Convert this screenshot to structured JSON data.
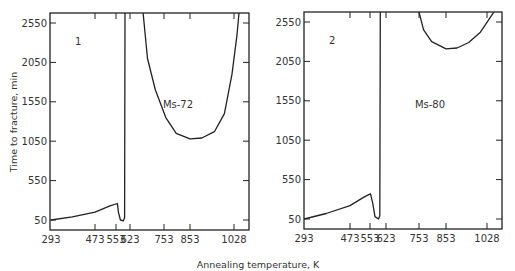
{
  "chart_data": [
    {
      "type": "line",
      "panel_label": "1",
      "annotation": "Ms-72",
      "xlabel": "Annealing temperature, K",
      "ylabel": "Time to fracture, min",
      "xticks": [
        293,
        473,
        553,
        623,
        753,
        853,
        1028
      ],
      "yticks": [
        50,
        550,
        1050,
        1550,
        2050,
        2550
      ],
      "xlim": [
        293,
        1073
      ],
      "ylim": [
        0,
        2680
      ],
      "series": [
        {
          "name": "low-temperature branch",
          "x": [
            293,
            380,
            473,
            530,
            560,
            565,
            575,
            590,
            596,
            598
          ],
          "y": [
            50,
            90,
            150,
            230,
            260,
            150,
            50,
            40,
            80,
            2680
          ]
        },
        {
          "name": "Ms-72 U-curve",
          "x": [
            673,
            690,
            720,
            760,
            800,
            853,
            900,
            950,
            990,
            1020,
            1040,
            1048
          ],
          "y": [
            2680,
            2100,
            1700,
            1350,
            1150,
            1080,
            1090,
            1170,
            1400,
            1900,
            2400,
            2680
          ]
        }
      ]
    },
    {
      "type": "line",
      "panel_label": "2",
      "annotation": "Ms-80",
      "xlabel": "Annealing temperature, K",
      "ylabel": "Time to fracture, min",
      "xticks": [
        293,
        473,
        553,
        623,
        753,
        853,
        1028
      ],
      "yticks": [
        50,
        550,
        1050,
        1550,
        2050,
        2550
      ],
      "xlim": [
        293,
        1073
      ],
      "ylim": [
        0,
        2680
      ],
      "series": [
        {
          "name": "low-temperature branch",
          "x": [
            293,
            380,
            473,
            530,
            555,
            565,
            575,
            590,
            596,
            598
          ],
          "y": [
            50,
            120,
            220,
            330,
            370,
            250,
            80,
            50,
            90,
            2680
          ]
        },
        {
          "name": "Ms-80 arc",
          "x": [
            753,
            770,
            800,
            853,
            900,
            950,
            1000,
            1040,
            1058
          ],
          "y": [
            2680,
            2450,
            2300,
            2210,
            2220,
            2290,
            2420,
            2600,
            2680
          ]
        }
      ]
    }
  ],
  "labels": {
    "ylabel": "Time to fracture, min",
    "xlabel": "Annealing temperature, K",
    "panel1": "1",
    "panel2": "2",
    "ann1": "Ms-72",
    "ann2": "Ms-80"
  }
}
